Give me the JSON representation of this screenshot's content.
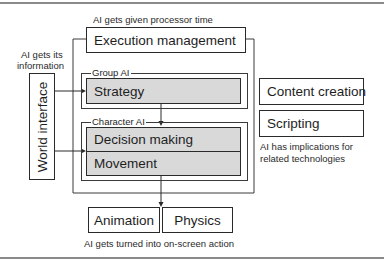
{
  "diagram": {
    "captions": {
      "top": "AI gets given processor time",
      "left": [
        "AI gets its",
        "information"
      ],
      "right": [
        "AI has implications for",
        "related technologies"
      ],
      "bottom": "AI gets turned into on-screen action"
    },
    "boxes": {
      "execution_management": "Execution management",
      "world_interface": "World interface",
      "strategy": "Strategy",
      "decision_making": "Decision making",
      "movement": "Movement",
      "animation": "Animation",
      "physics": "Physics",
      "content_creation": "Content creation",
      "scripting": "Scripting"
    },
    "groups": {
      "group_ai": "Group AI",
      "character_ai": "Character AI"
    },
    "colors": {
      "shaded_fill": "#d9d9d9",
      "line": "#2a2a2a"
    }
  }
}
